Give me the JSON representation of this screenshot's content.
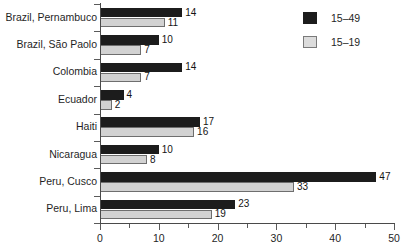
{
  "chart_data": {
    "type": "bar",
    "orientation": "horizontal",
    "title": "",
    "xlabel": "",
    "ylabel": "",
    "xlim": [
      0,
      50
    ],
    "xticks": [
      0,
      10,
      20,
      30,
      40,
      50
    ],
    "xtick_labels": [
      "0",
      "10",
      "20",
      "30",
      "40",
      "50"
    ],
    "minor_xticks": [
      5,
      15,
      25,
      35,
      45
    ],
    "grid": false,
    "legend_position": "upper right",
    "categories": [
      "Brazil, Pernambuco",
      "Brazil, São Paolo",
      "Colombia",
      "Ecuador",
      "Haiti",
      "Nicaragua",
      "Peru, Cusco",
      "Peru, Lima"
    ],
    "series": [
      {
        "name": "15–49",
        "color": "#1c1c1c",
        "values": [
          14,
          10,
          14,
          4,
          17,
          10,
          47,
          23
        ],
        "value_labels": [
          "14",
          "10",
          "14",
          "4",
          "17",
          "10",
          "47",
          "23"
        ]
      },
      {
        "name": "15–19",
        "color": "#d2d2d2",
        "values": [
          11,
          7,
          7,
          2,
          16,
          8,
          33,
          19
        ],
        "value_labels": [
          "11",
          "7",
          "7",
          "2",
          "16",
          "8",
          "33",
          "19"
        ]
      }
    ]
  },
  "legend": {
    "entries": [
      {
        "label": "15–49",
        "swatch": "dark-swatch"
      },
      {
        "label": "15–19",
        "swatch": "light-swatch"
      }
    ]
  }
}
